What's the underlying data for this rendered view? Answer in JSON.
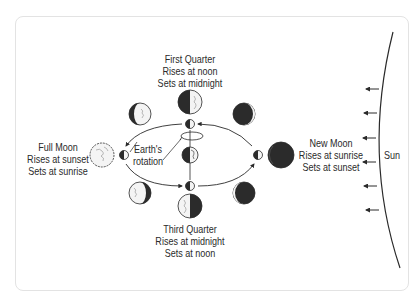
{
  "diagram": {
    "labels": {
      "first_quarter": {
        "title": "First Quarter",
        "rises": "Rises at noon",
        "sets": "Sets at midnight"
      },
      "full_moon": {
        "title": "Full Moon",
        "rises": "Rises at sunset",
        "sets": "Sets at sunrise"
      },
      "new_moon": {
        "title": "New Moon",
        "rises": "Rises at sunrise",
        "sets": "Sets at sunset"
      },
      "third_quarter": {
        "title": "Third Quarter",
        "rises": "Rises at midnight",
        "sets": "Sets at noon"
      },
      "earth_rotation": {
        "line1": "Earth's",
        "line2": "rotation"
      },
      "sun": "Sun"
    },
    "moon_phases": [
      "waxing-gibbous",
      "first-quarter",
      "waxing-crescent",
      "full-moon",
      "new-moon",
      "waning-gibbous",
      "third-quarter",
      "waning-crescent"
    ],
    "colors": {
      "ink": "#2a2a2a",
      "border": "#e3e3e3",
      "moon_light": "#f4f4f4",
      "moon_dark": "#2b2b2b"
    }
  }
}
